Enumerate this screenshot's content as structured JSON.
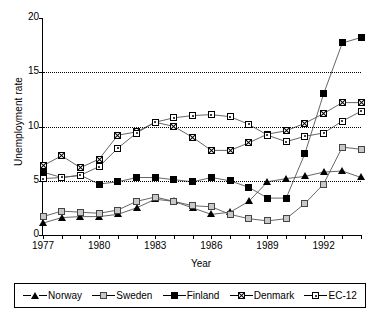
{
  "chart_data": {
    "type": "line",
    "title": "",
    "xlabel": "Year",
    "ylabel": "Unemployment rate",
    "xlim": [
      1977,
      1994
    ],
    "ylim": [
      0,
      20
    ],
    "yticks": [
      0,
      5,
      10,
      15,
      20
    ],
    "xticks_labeled": [
      1977,
      1980,
      1983,
      1986,
      1989,
      1992
    ],
    "grid": "horizontal dotted at 5, 10, 15",
    "legend_position": "below-boxed",
    "x": [
      1977,
      1978,
      1979,
      1980,
      1981,
      1982,
      1983,
      1984,
      1985,
      1986,
      1987,
      1988,
      1989,
      1990,
      1991,
      1992,
      1993,
      1994
    ],
    "series": [
      {
        "name": "Norway",
        "marker": "filled-triangle",
        "values": [
          1.1,
          1.6,
          1.7,
          1.7,
          1.9,
          2.5,
          3.3,
          3.1,
          2.5,
          1.9,
          2.1,
          3.1,
          4.9,
          5.2,
          5.4,
          5.8,
          5.9,
          5.3
        ]
      },
      {
        "name": "Sweden",
        "marker": "grey-square",
        "values": [
          1.7,
          2.2,
          2.1,
          2.0,
          2.3,
          3.1,
          3.5,
          3.1,
          2.7,
          2.6,
          1.9,
          1.5,
          1.3,
          1.5,
          2.9,
          4.7,
          8.1,
          7.9
        ]
      },
      {
        "name": "Finland",
        "marker": "black-square",
        "values": [
          5.8,
          5.3,
          5.5,
          4.7,
          4.9,
          5.3,
          5.3,
          5.1,
          4.9,
          5.3,
          5.0,
          4.4,
          3.4,
          3.4,
          7.5,
          13.0,
          17.7,
          18.2
        ]
      },
      {
        "name": "Denmark",
        "marker": "square-with-x",
        "values": [
          6.4,
          7.3,
          6.2,
          7.0,
          9.2,
          9.5,
          10.4,
          10.0,
          9.0,
          7.8,
          7.8,
          8.5,
          9.3,
          9.6,
          10.3,
          11.2,
          12.2,
          12.2
        ]
      },
      {
        "name": "EC-12",
        "marker": "square-with-dot",
        "values": [
          5.2,
          5.3,
          5.5,
          6.3,
          8.0,
          9.4,
          10.4,
          10.8,
          11.0,
          11.1,
          10.9,
          10.2,
          9.2,
          8.6,
          9.1,
          9.4,
          10.5,
          11.4
        ]
      }
    ]
  },
  "axes": {
    "y_title": "Unemployment rate",
    "x_title": "Year",
    "y_tick_labels": [
      "0",
      "5",
      "10",
      "15",
      "20"
    ],
    "x_tick_labels": [
      "1977",
      "1980",
      "1983",
      "1986",
      "1989",
      "1992"
    ]
  },
  "legend": {
    "items": [
      {
        "label": "Norway",
        "icon": "filled-triangle-marker"
      },
      {
        "label": "Sweden",
        "icon": "grey-square-marker"
      },
      {
        "label": "Finland",
        "icon": "black-square-marker"
      },
      {
        "label": "Denmark",
        "icon": "square-with-x-marker"
      },
      {
        "label": "EC-12",
        "icon": "square-with-dot-marker"
      }
    ]
  }
}
